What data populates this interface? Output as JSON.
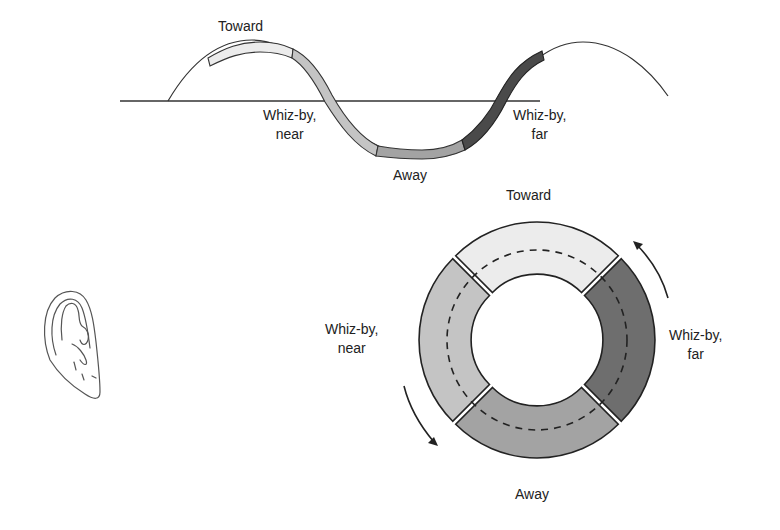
{
  "wave": {
    "labels": {
      "toward": "Toward",
      "whizby_near": "Whiz-by,\nnear",
      "away": "Away",
      "whizby_far": "Whiz-by,\nfar"
    }
  },
  "ring": {
    "labels": {
      "toward": "Toward",
      "whizby_near": "Whiz-by,\nnear",
      "away": "Away",
      "whizby_far": "Whiz-by,\nfar"
    },
    "segment_colors": {
      "toward": "#ececec",
      "whizby_near": "#c4c4c4",
      "away": "#a3a3a3",
      "whizby_far": "#6e6e6e"
    }
  },
  "icons": {
    "ear": "ear-icon"
  }
}
